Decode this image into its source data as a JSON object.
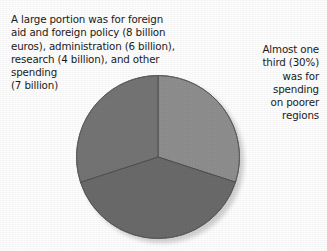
{
  "figure": {
    "background_color": "#fdfdfd",
    "text_color": "#1b1b1b"
  },
  "captions": {
    "left": "A large portion was for foreign\naid and foreign policy (8 billion\neuros), administration (6 billion),\nresearch (4 billion), and other\nspending\n(7 billion)",
    "right": "Almost one\nthird (30%)\nwas for\nspending\non poorer\nregions"
  },
  "chart_data": {
    "type": "pie",
    "title": "",
    "labels": [
      "Spending on poorer regions",
      "Foreign aid and foreign policy, administration, research and other spending",
      "Remaining spending"
    ],
    "values": [
      30,
      40,
      30
    ],
    "units": "percent",
    "colors": [
      "#8e8e8e",
      "#6a6a6a",
      "#747474"
    ],
    "start_angle_deg": 0,
    "direction": "clockwise",
    "legend": "none",
    "grid": false,
    "annotations": [
      {
        "slice": "Spending on poorer regions",
        "text": "Almost one third (30%) was for spending on poorer regions",
        "position": "right"
      },
      {
        "slice": "Foreign aid and foreign policy, administration, research and other spending",
        "text": "A large portion was for foreign aid and foreign policy (8 billion euros), administration (6 billion), research (4 billion), and other spending (7 billion)",
        "position": "top-left"
      }
    ],
    "detail_values": [
      {
        "category": "Foreign aid and foreign policy",
        "value": 8,
        "units": "billion euros"
      },
      {
        "category": "Administration",
        "value": 6,
        "units": "billion euros"
      },
      {
        "category": "Research",
        "value": 4,
        "units": "billion euros"
      },
      {
        "category": "Other spending",
        "value": 7,
        "units": "billion euros"
      }
    ]
  }
}
